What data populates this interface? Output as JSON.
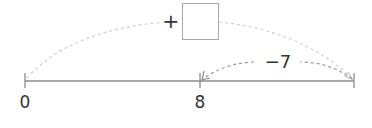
{
  "diagram": {
    "type": "number-line-jumps",
    "ticks": [
      {
        "value_label": "0",
        "x": 25
      },
      {
        "value_label": "8",
        "x": 200
      },
      {
        "value_label": "",
        "x": 354
      }
    ],
    "jumps": [
      {
        "from": "0",
        "to": "end",
        "operator": "+",
        "amount_label": "",
        "blank_box": true,
        "style": "dashed",
        "direction": "right"
      },
      {
        "from": "end",
        "to": "8",
        "label": "−7",
        "style": "dashed",
        "direction": "left"
      }
    ],
    "plus_sign": "+",
    "minus_label": "−7",
    "colors": {
      "axis": "#8c8c8c",
      "dashed_arc": "#c8c8c8",
      "text": "#333333",
      "box_border": "#a8a8a8"
    }
  }
}
